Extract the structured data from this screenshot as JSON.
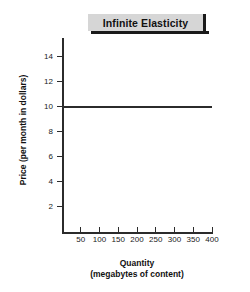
{
  "chart_data": {
    "type": "line",
    "title": "Infinite Elasticity",
    "xlabel_lines": [
      "Quantity",
      "(megabytes of content)"
    ],
    "ylabel": "Price (per month in dollars)",
    "x": [
      0,
      400
    ],
    "values": [
      10,
      10
    ],
    "series": [
      {
        "name": "Perfectly elastic demand",
        "x": [
          0,
          400
        ],
        "values": [
          10,
          10
        ]
      }
    ],
    "xlim": [
      0,
      400
    ],
    "ylim": [
      0,
      15.5
    ],
    "xticks": [
      50,
      100,
      150,
      200,
      250,
      300,
      350,
      400
    ],
    "xtick_labels": [
      "50",
      "100",
      "150",
      "200",
      "250",
      "300",
      "350",
      "400"
    ],
    "yticks": [
      2,
      4,
      6,
      8,
      10,
      12,
      14
    ],
    "ytick_labels": [
      "2",
      "4",
      "6",
      "8",
      "10",
      "12",
      "14"
    ],
    "grid": false,
    "legend": null,
    "line_color": "#2b2b2b",
    "axis_color": "#2b2b2b",
    "title_background": "#d6d6d6",
    "background": "#ffffff"
  }
}
